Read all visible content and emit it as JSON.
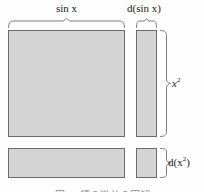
{
  "figure": {
    "background_color": "#fdfdfd",
    "fill_color": "#d4d4d4",
    "stroke_color": "#6b6b6b",
    "brace_color": "#7d7d7d",
    "text_color": "#1a1a1a"
  },
  "labels": {
    "width_main": "sin x",
    "width_differential": "d(sin x)",
    "height_main": "x",
    "height_main_exponent": "2",
    "height_differential": "d(x",
    "height_differential_exponent": "2",
    "height_differential_close": ")"
  },
  "regions": [
    {
      "name": "main-area",
      "width_label": "sin x",
      "height_label": "x²"
    },
    {
      "name": "d-sin-x-strip",
      "width_label": "d(sin x)",
      "height_label": "x²"
    },
    {
      "name": "d-x-squared-strip",
      "width_label": "sin x",
      "height_label": "d(x²)"
    },
    {
      "name": "corner-product-strip",
      "width_label": "d(sin x)",
      "height_label": "d(x²)"
    }
  ],
  "caption": {
    "text": "図 ― 積の微分の図解"
  }
}
